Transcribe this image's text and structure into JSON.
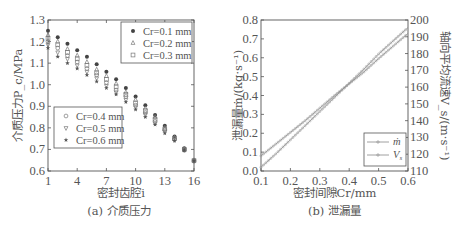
{
  "chart_data": [
    {
      "type": "scatter",
      "title": "",
      "caption": "(a) 介质压力",
      "xlabel": "密封齿腔i",
      "ylabel": "介质压力P_c/MPa",
      "xlim": [
        1,
        16
      ],
      "ylim": [
        0.6,
        1.3
      ],
      "xticks": [
        1,
        4,
        7,
        10,
        13,
        16
      ],
      "yticks": [
        0.6,
        0.7,
        0.8,
        0.9,
        1.0,
        1.1,
        1.2,
        1.3
      ],
      "ytick_labels": [
        "0.6",
        "0.7",
        "0.8",
        "0.9",
        "1.0",
        "1.1",
        "1.2",
        "1.3"
      ],
      "grid": false,
      "x": [
        1,
        2,
        3,
        4,
        5,
        6,
        7,
        8,
        9,
        10,
        11,
        12,
        13,
        14,
        15,
        16
      ],
      "series": [
        {
          "name": "Cr=0.1 mm",
          "marker": "filled-circle",
          "values": [
            1.25,
            1.22,
            1.19,
            1.16,
            1.13,
            1.095,
            1.06,
            1.025,
            0.985,
            0.945,
            0.905,
            0.86,
            0.81,
            0.76,
            0.705,
            0.65
          ]
        },
        {
          "name": "Cr=0.2 mm",
          "marker": "triangle-up",
          "values": [
            1.23,
            1.2,
            1.165,
            1.135,
            1.105,
            1.07,
            1.04,
            1.005,
            0.965,
            0.93,
            0.89,
            0.85,
            0.8,
            0.755,
            0.7,
            0.65
          ]
        },
        {
          "name": "Cr=0.3 mm",
          "marker": "square",
          "values": [
            1.215,
            1.185,
            1.15,
            1.12,
            1.09,
            1.055,
            1.025,
            0.99,
            0.955,
            0.915,
            0.88,
            0.84,
            0.795,
            0.75,
            0.7,
            0.648
          ]
        },
        {
          "name": "Cr=0.4 mm",
          "marker": "circle",
          "values": [
            1.2,
            1.17,
            1.135,
            1.105,
            1.075,
            1.045,
            1.01,
            0.975,
            0.945,
            0.905,
            0.87,
            0.83,
            0.79,
            0.748,
            0.698,
            0.647
          ]
        },
        {
          "name": "Cr=0.5 mm",
          "marker": "triangle-down",
          "values": [
            1.185,
            1.15,
            1.12,
            1.09,
            1.06,
            1.03,
            0.995,
            0.965,
            0.93,
            0.895,
            0.86,
            0.82,
            0.782,
            0.744,
            0.697,
            0.646
          ]
        },
        {
          "name": "Cr=0.6 mm",
          "marker": "star",
          "values": [
            1.17,
            1.13,
            1.1,
            1.075,
            1.045,
            1.015,
            0.985,
            0.955,
            0.92,
            0.885,
            0.85,
            0.815,
            0.775,
            0.74,
            0.695,
            0.645
          ]
        }
      ],
      "legend": [
        {
          "position": "upper-right",
          "entries": [
            "Cr=0.1 mm",
            "Cr=0.2 mm",
            "Cr=0.3 mm"
          ]
        },
        {
          "position": "lower-left",
          "entries": [
            "Cr=0.4 mm",
            "Cr=0.5 mm",
            "Cr=0.6 mm"
          ]
        }
      ]
    },
    {
      "type": "line",
      "title": "",
      "caption": "(b) 泄漏量",
      "xlabel": "密封间隙Cr/mm",
      "ylabel": "泄漏量ṁ/(kg·s⁻¹)",
      "y2label": "轴向平均流速V_s/(m·s⁻¹)",
      "xlim": [
        0.1,
        0.6
      ],
      "ylim": [
        0.0,
        0.8
      ],
      "y2lim": [
        110,
        200
      ],
      "xticks": [
        0.1,
        0.2,
        0.3,
        0.4,
        0.5,
        0.6
      ],
      "yticks": [
        0.0,
        0.1,
        0.2,
        0.3,
        0.4,
        0.5,
        0.6,
        0.7,
        0.8
      ],
      "y2ticks": [
        110,
        120,
        130,
        140,
        150,
        160,
        170,
        180,
        190,
        200
      ],
      "grid": false,
      "x": [
        0.1,
        0.15,
        0.2,
        0.25,
        0.3,
        0.35,
        0.4,
        0.45,
        0.5,
        0.55,
        0.6
      ],
      "series": [
        {
          "name": "ṁ",
          "axis": "left",
          "marker": "circle",
          "values": [
            0.02,
            0.09,
            0.165,
            0.24,
            0.315,
            0.39,
            0.465,
            0.54,
            0.62,
            0.69,
            0.76
          ]
        },
        {
          "name": "V_s",
          "axis": "right",
          "marker": "circle",
          "values": [
            119,
            126,
            133,
            140,
            147.5,
            155,
            162,
            169,
            177,
            184.5,
            192
          ]
        }
      ],
      "legend": {
        "position": "lower-right",
        "entries": [
          "ṁ",
          "V_s"
        ]
      }
    }
  ]
}
